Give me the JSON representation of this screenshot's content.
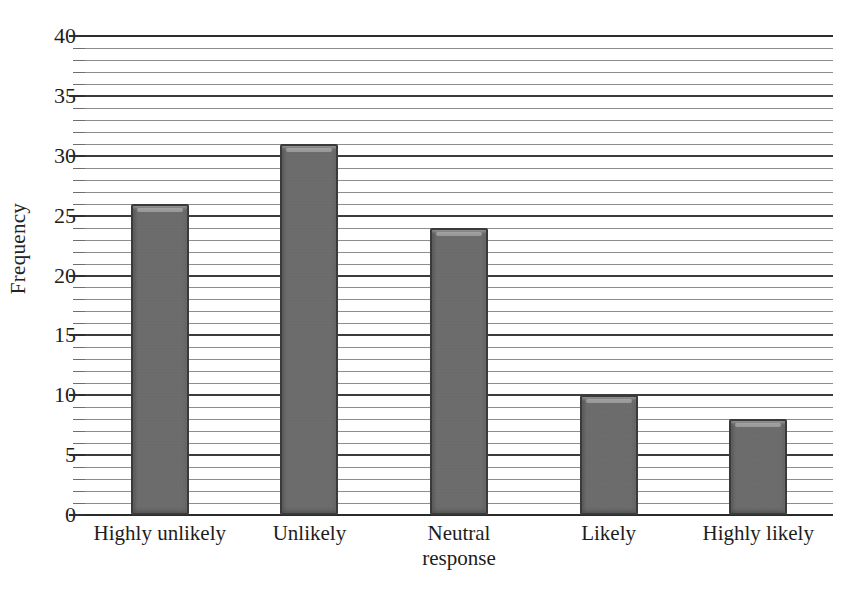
{
  "chart_data": {
    "type": "bar",
    "title": "",
    "xlabel": "",
    "ylabel": "Frequency",
    "categories": [
      "Highly unlikely",
      "Unlikely",
      "Neutral response",
      "Likely",
      "Highly likely"
    ],
    "category_lines": [
      [
        "Highly unlikely"
      ],
      [
        "Unlikely"
      ],
      [
        "Neutral",
        "response"
      ],
      [
        "Likely"
      ],
      [
        "Highly likely"
      ]
    ],
    "values": [
      26,
      31,
      24,
      10,
      8
    ],
    "ylim": [
      0,
      40
    ],
    "major_ticks": [
      0,
      5,
      10,
      15,
      20,
      25,
      30,
      35,
      40
    ],
    "minor_tick_step": 1,
    "grid": true,
    "grid_orientation": "horizontal",
    "legend": "none",
    "bar_color": "#6b6b6b",
    "bar_edge_color": "#3a3a3a",
    "gridline_color": "#8d8d8d",
    "major_gridline_color": "#3c3c3c",
    "axis_color": "#2a2a2a",
    "text_color": "#1d1d1d"
  },
  "ytick_labels": [
    "40",
    "35",
    "30",
    "25",
    "20",
    "15",
    "10",
    "5",
    "0"
  ]
}
